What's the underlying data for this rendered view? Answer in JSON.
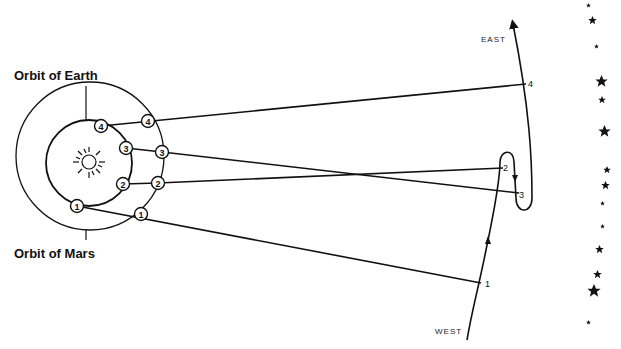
{
  "diagram": {
    "labels": {
      "orbit_earth": "Orbit of Earth",
      "orbit_mars": "Orbit of Mars",
      "east": "EAST",
      "west": "WEST"
    },
    "earth_positions": [
      {
        "n": "1",
        "x": 77,
        "y": 206
      },
      {
        "n": "2",
        "x": 123,
        "y": 184
      },
      {
        "n": "3",
        "x": 126,
        "y": 148
      },
      {
        "n": "4",
        "x": 101,
        "y": 126
      }
    ],
    "mars_positions": [
      {
        "n": "1",
        "x": 141,
        "y": 214
      },
      {
        "n": "2",
        "x": 158,
        "y": 183
      },
      {
        "n": "3",
        "x": 162,
        "y": 152
      },
      {
        "n": "4",
        "x": 148,
        "y": 121
      }
    ],
    "sky_positions": [
      {
        "n": "1",
        "x": 481,
        "y": 283
      },
      {
        "n": "2",
        "x": 503,
        "y": 168
      },
      {
        "n": "3",
        "x": 519,
        "y": 193
      },
      {
        "n": "4",
        "x": 526,
        "y": 84
      }
    ],
    "colors": {
      "ink": "#111111",
      "background": "#ffffff"
    }
  }
}
